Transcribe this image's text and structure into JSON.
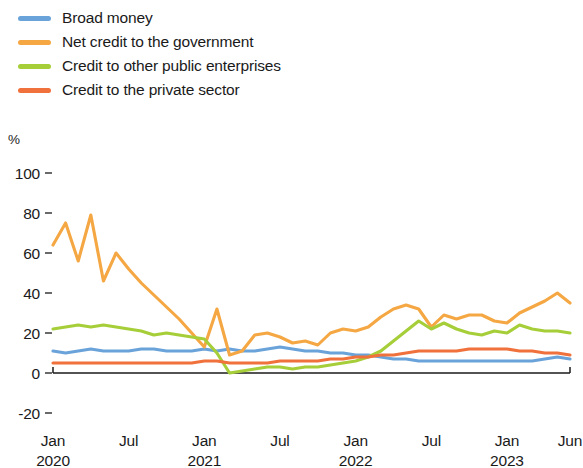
{
  "chart_data": {
    "type": "line",
    "title": "",
    "subtitle": "",
    "xlabel": "",
    "ylabel": "%",
    "yunit": "%",
    "ylim": [
      -20,
      100
    ],
    "yticks": [
      100,
      80,
      60,
      40,
      20,
      0,
      -20
    ],
    "ytick_labels": [
      "100",
      "80",
      "60",
      "40",
      "20",
      "0",
      "-20"
    ],
    "grid": false,
    "legend_position": "top-left",
    "x_start": "Jan 2020",
    "x_end": "Jun 2023",
    "x_frequency": "monthly",
    "xticks": [
      {
        "label": "Jan",
        "year": "2020",
        "index": 0
      },
      {
        "label": "Jul",
        "year": "",
        "index": 6
      },
      {
        "label": "Jan",
        "year": "2021",
        "index": 12
      },
      {
        "label": "Jul",
        "year": "",
        "index": 18
      },
      {
        "label": "Jan",
        "year": "2022",
        "index": 24
      },
      {
        "label": "Jul",
        "year": "",
        "index": 30
      },
      {
        "label": "Jan",
        "year": "2023",
        "index": 36
      },
      {
        "label": "Jun",
        "year": "",
        "index": 41
      }
    ],
    "x": [
      "Jan 2020",
      "Feb 2020",
      "Mar 2020",
      "Apr 2020",
      "May 2020",
      "Jun 2020",
      "Jul 2020",
      "Aug 2020",
      "Sep 2020",
      "Oct 2020",
      "Nov 2020",
      "Dec 2020",
      "Jan 2021",
      "Feb 2021",
      "Mar 2021",
      "Apr 2021",
      "May 2021",
      "Jun 2021",
      "Jul 2021",
      "Aug 2021",
      "Sep 2021",
      "Oct 2021",
      "Nov 2021",
      "Dec 2021",
      "Jan 2022",
      "Feb 2022",
      "Mar 2022",
      "Apr 2022",
      "May 2022",
      "Jun 2022",
      "Jul 2022",
      "Aug 2022",
      "Sep 2022",
      "Oct 2022",
      "Nov 2022",
      "Dec 2022",
      "Jan 2023",
      "Feb 2023",
      "Mar 2023",
      "Apr 2023",
      "May 2023",
      "Jun 2023"
    ],
    "series": [
      {
        "name": "Broad money",
        "color": "#6aa3d9",
        "values": [
          11,
          10,
          11,
          12,
          11,
          11,
          11,
          12,
          12,
          11,
          11,
          11,
          12,
          11,
          12,
          11,
          11,
          12,
          13,
          12,
          11,
          11,
          10,
          10,
          9,
          9,
          8,
          7,
          7,
          6,
          6,
          6,
          6,
          6,
          6,
          6,
          6,
          6,
          6,
          7,
          8,
          7
        ]
      },
      {
        "name": "Net credit to the government",
        "color": "#f4a742",
        "values": [
          64,
          75,
          56,
          79,
          46,
          60,
          52,
          45,
          39,
          33,
          27,
          20,
          13,
          32,
          9,
          11,
          19,
          20,
          18,
          15,
          16,
          14,
          20,
          22,
          21,
          23,
          28,
          32,
          34,
          32,
          23,
          29,
          27,
          29,
          29,
          26,
          25,
          30,
          33,
          36,
          40,
          35
        ]
      },
      {
        "name": "Credit to other public enterprises",
        "color": "#a6ce39",
        "values": [
          22,
          23,
          24,
          23,
          24,
          23,
          22,
          21,
          19,
          20,
          19,
          18,
          17,
          10,
          0,
          1,
          2,
          3,
          3,
          2,
          3,
          3,
          4,
          5,
          6,
          8,
          11,
          16,
          21,
          26,
          22,
          25,
          22,
          20,
          19,
          21,
          20,
          24,
          22,
          21,
          21,
          20
        ]
      },
      {
        "name": "Credit to the private sector",
        "color": "#f0713c",
        "values": [
          5,
          5,
          5,
          5,
          5,
          5,
          5,
          5,
          5,
          5,
          5,
          5,
          6,
          6,
          5,
          5,
          5,
          5,
          6,
          6,
          6,
          6,
          7,
          7,
          8,
          8,
          9,
          9,
          10,
          11,
          11,
          11,
          11,
          12,
          12,
          12,
          12,
          11,
          11,
          10,
          10,
          9
        ]
      }
    ]
  },
  "legend": {
    "items": [
      {
        "label": "Broad money",
        "color": "#6aa3d9"
      },
      {
        "label": "Net credit to the government",
        "color": "#f4a742"
      },
      {
        "label": "Credit to other public enterprises",
        "color": "#a6ce39"
      },
      {
        "label": "Credit to the private sector",
        "color": "#f0713c"
      }
    ]
  }
}
